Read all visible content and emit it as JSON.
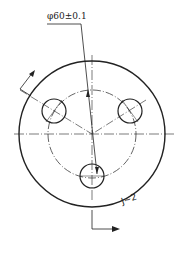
{
  "drawing": {
    "dimension_text": "φ60±0.1",
    "section_label": "J~2",
    "stroke_color": "#222222",
    "background": "#ffffff"
  }
}
